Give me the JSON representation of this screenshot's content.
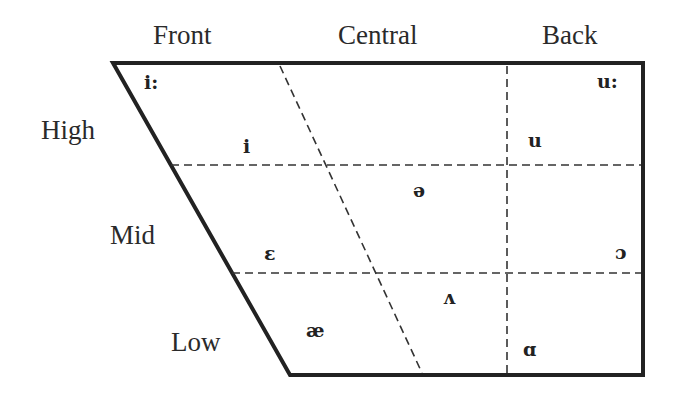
{
  "columns": {
    "front": "Front",
    "central": "Central",
    "back": "Back"
  },
  "rows": {
    "high": "High",
    "mid": "Mid",
    "low": "Low"
  },
  "vowels": {
    "i_long": "i:",
    "i": "i",
    "u_long": "u:",
    "u": "u",
    "schwa": "ə",
    "epsilon": "ɛ",
    "open_o": "ɔ",
    "wedge": "ʌ",
    "ash": "æ",
    "alpha": "ɑ"
  },
  "colors": {
    "line": "#222222",
    "text": "#2a2a2a"
  }
}
